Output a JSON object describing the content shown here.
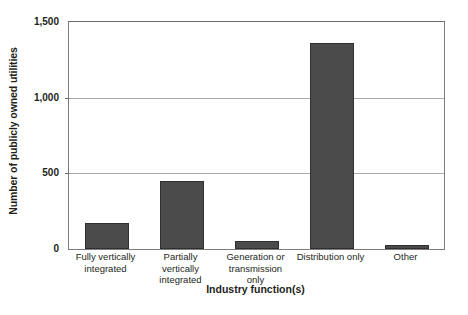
{
  "chart_data": {
    "type": "bar",
    "title": "",
    "xlabel": "Industry function(s)",
    "ylabel": "Number of publicly owned utilities",
    "categories": [
      "Fully vertically integrated",
      "Partially vertically integrated",
      "Generation or transmission only",
      "Distribution only",
      "Other"
    ],
    "values": [
      170,
      450,
      50,
      1360,
      25
    ],
    "ylim": [
      0,
      1500
    ],
    "yticks": [
      0,
      500,
      1000,
      1500
    ],
    "ytick_labels": [
      "0",
      "500",
      "1,000",
      "1,500"
    ],
    "grid": "horizontal",
    "legend": "none",
    "bar_color": "#4b4b4b",
    "gridline_color": "#a9a9a9",
    "axis_color": "#6b6b6b",
    "background_color": "#ffffff"
  }
}
